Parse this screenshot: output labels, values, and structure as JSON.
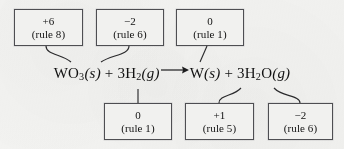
{
  "figure": {
    "background_color": "#f3f3f1",
    "ink_color": "#111111",
    "box_border_color": "#4e4e52"
  },
  "equation": {
    "reactant_1_formula": "WO",
    "reactant_1_sub": "3",
    "reactant_1_state": "(s)",
    "plus_1": "+",
    "reactant_2_coefficient": "3H",
    "reactant_2_sub": "2",
    "reactant_2_state": "(g)",
    "arrow": "reaction-arrow-right",
    "product_1_formula": "W",
    "product_1_state": "(s)",
    "plus_2": "+",
    "product_2_coefficient": "3H",
    "product_2_sub": "2",
    "product_2_formula": "O",
    "product_2_state": "(g)",
    "plain_text": "WO3(s) + 3H2(g) ⟶ W(s) + 3H2O(g)"
  },
  "top_labels": [
    {
      "id": "w-in-wo3",
      "oxidation_number": "+6",
      "rule": "(rule 8)",
      "points_to": "W in WO3"
    },
    {
      "id": "o-in-wo3",
      "oxidation_number": "−2",
      "rule": "(rule 6)",
      "points_to": "O in WO3"
    },
    {
      "id": "w-product",
      "oxidation_number": "0",
      "rule": "(rule 1)",
      "points_to": "W(s)"
    }
  ],
  "bottom_labels": [
    {
      "id": "h2-reactant",
      "oxidation_number": "0",
      "rule": "(rule 1)",
      "points_to": "3H2(g)"
    },
    {
      "id": "h-in-h2o",
      "oxidation_number": "+1",
      "rule": "(rule 5)",
      "points_to": "H in 3H2O"
    },
    {
      "id": "o-in-h2o",
      "oxidation_number": "−2",
      "rule": "(rule 6)",
      "points_to": "O in 3H2O"
    }
  ]
}
